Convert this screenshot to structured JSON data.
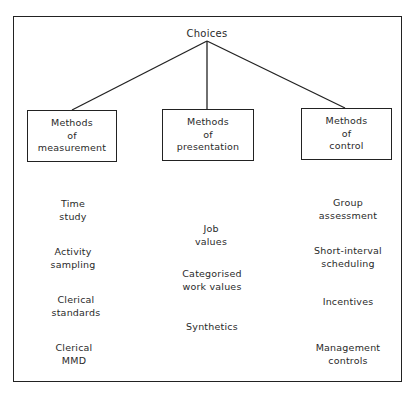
{
  "diagram": {
    "root": "Choices",
    "branches": [
      {
        "title_lines": [
          "Methods",
          "of",
          "measurement"
        ],
        "items": [
          [
            "Time",
            "study"
          ],
          [
            "Activity",
            "sampling"
          ],
          [
            "Clerical",
            "standards"
          ],
          [
            "Clerical",
            "MMD"
          ]
        ]
      },
      {
        "title_lines": [
          "Methods",
          "of",
          "presentation"
        ],
        "items": [
          [
            "Job",
            "values"
          ],
          [
            "Categorised",
            "work values"
          ],
          [
            "Synthetics"
          ]
        ]
      },
      {
        "title_lines": [
          "Methods",
          "of",
          "control"
        ],
        "items": [
          [
            "Group",
            "assessment"
          ],
          [
            "Short-interval",
            "scheduling"
          ],
          [
            "Incentives"
          ],
          [
            "Management",
            "controls"
          ]
        ]
      }
    ],
    "colors": {
      "line": "#222222",
      "text": "#2a2a2a",
      "background": "#ffffff"
    }
  }
}
